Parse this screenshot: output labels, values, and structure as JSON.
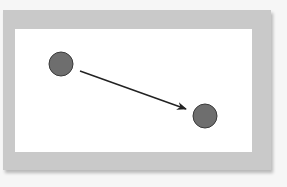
{
  "diagram": {
    "frame_color": "#c9c9c9",
    "canvas_color": "#ffffff",
    "nodes": [
      {
        "id": "node-a",
        "cx": 61,
        "cy": 64,
        "r": 12,
        "fill": "#6e6e6e",
        "stroke": "#3a3a3a"
      },
      {
        "id": "node-b",
        "cx": 205,
        "cy": 116,
        "r": 12,
        "fill": "#6e6e6e",
        "stroke": "#3a3a3a"
      }
    ],
    "edges": [
      {
        "from": "node-a",
        "to": "node-b",
        "x1": 80,
        "y1": 71,
        "x2": 186,
        "y2": 109,
        "color": "#222222",
        "arrow": "end"
      }
    ]
  }
}
